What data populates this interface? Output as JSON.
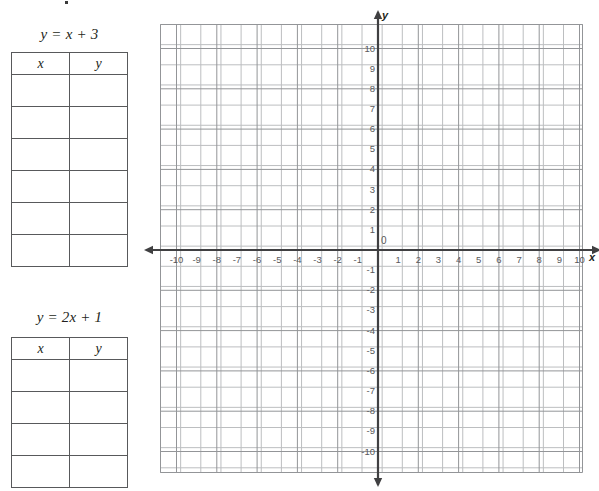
{
  "worksheet": {
    "tables": [
      {
        "id": "table-1",
        "equation": {
          "lhs": "y",
          "eq": "=",
          "rhs_var": "x",
          "plus": "+",
          "constant": "3",
          "full": "y = x + 3"
        },
        "columns": [
          "x",
          "y"
        ],
        "rows": [
          [
            "",
            ""
          ],
          [
            "",
            ""
          ],
          [
            "",
            ""
          ],
          [
            "",
            ""
          ],
          [
            "",
            ""
          ],
          [
            "",
            ""
          ]
        ]
      },
      {
        "id": "table-2",
        "equation": {
          "lhs": "y",
          "eq": "=",
          "coefficient": "2",
          "rhs_var": "x",
          "plus": "+",
          "constant": "1",
          "full": "y = 2x + 1"
        },
        "columns": [
          "x",
          "y"
        ],
        "rows": [
          [
            "",
            ""
          ],
          [
            "",
            ""
          ],
          [
            "",
            ""
          ],
          [
            "",
            ""
          ]
        ]
      }
    ]
  },
  "chart_data": {
    "type": "scatter",
    "title": "",
    "xlabel": "x",
    "ylabel": "y",
    "xlim": [
      -10.6,
      10.4
    ],
    "ylim": [
      -11.2,
      11.2
    ],
    "grid": true,
    "legend": "none",
    "origin_label": "0",
    "x_ticks": [
      -10,
      -9,
      -8,
      -7,
      -6,
      -5,
      -4,
      -3,
      -2,
      -1,
      1,
      2,
      3,
      4,
      5,
      6,
      7,
      8,
      9,
      10
    ],
    "y_ticks": [
      10,
      9,
      8,
      7,
      6,
      5,
      4,
      3,
      2,
      1,
      -1,
      -2,
      -3,
      -4,
      -5,
      -6,
      -7,
      -8,
      -9,
      -10
    ],
    "x_tick_labels": [
      "-10",
      "-9",
      "-8",
      "-7",
      "-6",
      "-5",
      "-4",
      "-3",
      "-2",
      "-1",
      "1",
      "2",
      "3",
      "4",
      "5",
      "6",
      "7",
      "8",
      "9",
      "10"
    ],
    "y_tick_labels": [
      "10",
      "9",
      "8",
      "7",
      "6",
      "5",
      "4",
      "3",
      "2",
      "1",
      "-1",
      "-2",
      "-3",
      "-4",
      "-5",
      "-6",
      "-7",
      "-8",
      "-9",
      "-10"
    ],
    "series": [],
    "axis_arrows": [
      "left",
      "right",
      "up",
      "down"
    ],
    "unit_px": 20.15,
    "colors": {
      "grid_line": "#bcbec0",
      "grid_major": "#939598",
      "axis": "#404042",
      "label": "#58595b",
      "table_border": "#58595b",
      "background": "#ffffff"
    }
  }
}
